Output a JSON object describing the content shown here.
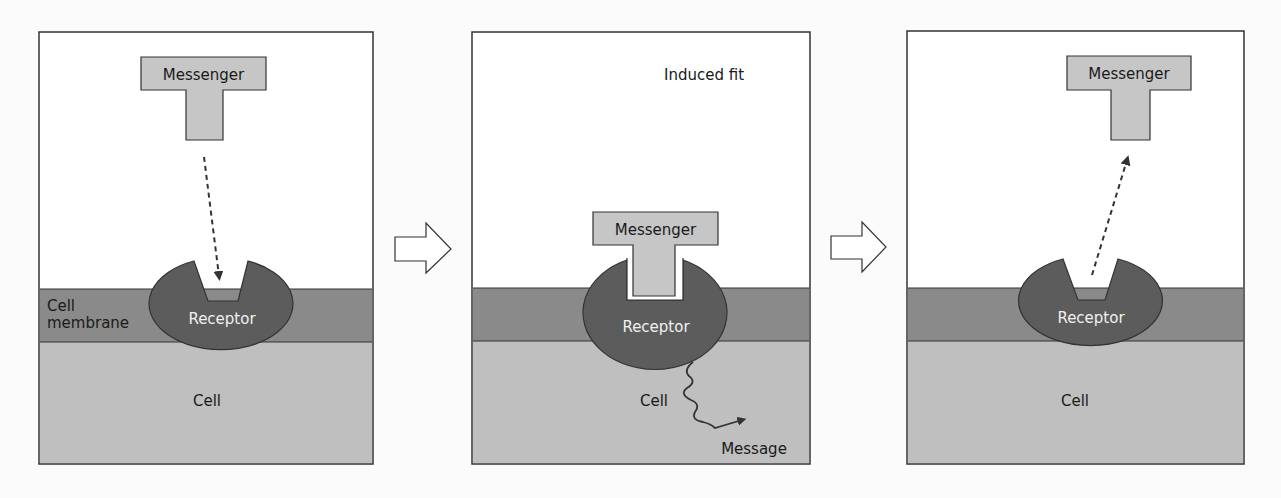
{
  "colors": {
    "background": "#fbfbfb",
    "panel_border": "#333333",
    "membrane": "#8a8a8a",
    "cell": "#bfbfbf",
    "receptor": "#5c5c5c",
    "messenger": "#c6c6c6",
    "text_dark": "#1a1a1a",
    "text_light": "#f0f0f0"
  },
  "panels": [
    {
      "id": "unbound",
      "messenger_label": "Messenger",
      "receptor_label": "Receptor",
      "membrane_label_line1": "Cell",
      "membrane_label_line2": "membrane",
      "cell_label": "Cell",
      "arrow": "dashed-arrow-down-to-receptor"
    },
    {
      "id": "bound",
      "title": "Induced fit",
      "messenger_label": "Messenger",
      "receptor_label": "Receptor",
      "cell_label": "Cell",
      "message_label": "Message",
      "arrow": "wavy-arrow-to-message"
    },
    {
      "id": "released",
      "messenger_label": "Messenger",
      "receptor_label": "Receptor",
      "cell_label": "Cell",
      "arrow": "dashed-arrow-up-away-from-receptor"
    }
  ],
  "transitions": [
    {
      "icon": "hollow-right-arrow-icon"
    },
    {
      "icon": "hollow-right-arrow-icon"
    }
  ]
}
